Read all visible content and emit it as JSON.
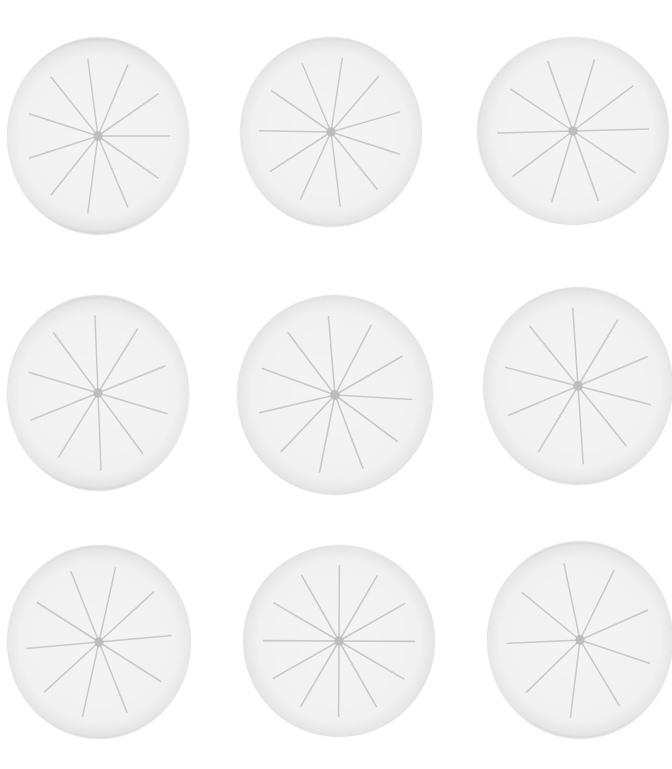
{
  "image": {
    "subject": "nine translucent citrus slices arranged in a 3x3 grid on white background",
    "palette": {
      "background": "#ffffff",
      "pulp": "#f2f2f2",
      "rind": "#5e5e5e"
    },
    "slices": [
      {
        "x": 8,
        "y": 38,
        "w": 180,
        "h": 196,
        "segments": 11
      },
      {
        "x": 241,
        "y": 38,
        "w": 180,
        "h": 188,
        "segments": 11
      },
      {
        "x": 478,
        "y": 38,
        "w": 190,
        "h": 186,
        "segments": 10
      },
      {
        "x": 8,
        "y": 296,
        "w": 180,
        "h": 194,
        "segments": 10
      },
      {
        "x": 238,
        "y": 296,
        "w": 194,
        "h": 198,
        "segments": 11
      },
      {
        "x": 484,
        "y": 288,
        "w": 188,
        "h": 196,
        "segments": 10
      },
      {
        "x": 8,
        "y": 546,
        "w": 182,
        "h": 192,
        "segments": 10
      },
      {
        "x": 244,
        "y": 546,
        "w": 190,
        "h": 190,
        "segments": 12
      },
      {
        "x": 488,
        "y": 542,
        "w": 184,
        "h": 196,
        "segments": 9
      }
    ]
  }
}
